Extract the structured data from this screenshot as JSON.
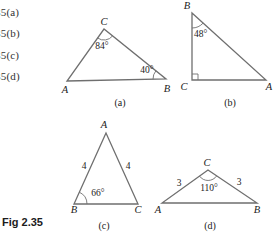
{
  "colors": {
    "background": "#ffffff",
    "line": "#6f6f6f",
    "text": "#222222"
  },
  "exercise_list": {
    "items": [
      "35(a)",
      "35(b)",
      "35(c)",
      "35(d)"
    ]
  },
  "fig_label": "Fig 2.35",
  "tri_a": {
    "caption": "(a)",
    "vertex_A": "A",
    "vertex_B": "B",
    "vertex_C": "C",
    "angle_at_C": "84°",
    "angle_at_B": "40°"
  },
  "tri_b": {
    "caption": "(b)",
    "vertex_A": "A",
    "vertex_B": "B",
    "vertex_C": "C",
    "angle_at_B": "48°",
    "right_angle_at": "C"
  },
  "tri_c": {
    "caption": "(c)",
    "vertex_A": "A",
    "vertex_B": "B",
    "vertex_C": "C",
    "angle_at_B": "66°",
    "side_AB": "4",
    "side_AC": "4"
  },
  "tri_d": {
    "caption": "(d)",
    "vertex_A": "A",
    "vertex_B": "B",
    "vertex_C": "C",
    "angle_at_C": "110°",
    "side_CA": "3",
    "side_CB": "3"
  }
}
